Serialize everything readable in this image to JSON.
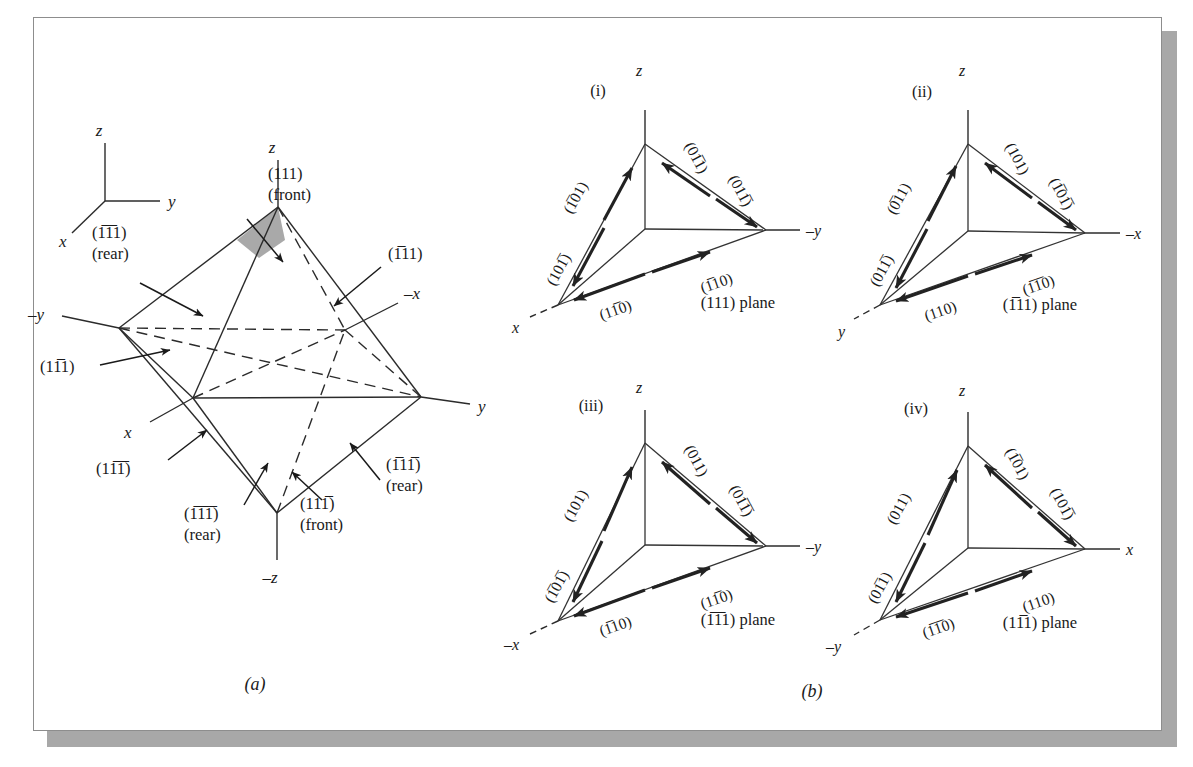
{
  "figure": {
    "captions": {
      "left": "(a)",
      "right": "(b)"
    }
  },
  "panel_a": {
    "axis_triad": {
      "z": "z",
      "y": "y",
      "x": "x"
    },
    "octahedron_axes": {
      "z": "z",
      "neg_z": "–z",
      "y": "y",
      "neg_y": "–y",
      "x": "x",
      "neg_x": "–x"
    },
    "face_labels": [
      {
        "id": "face-111-front",
        "plane": "(111)",
        "bars": [],
        "note": "(front)"
      },
      {
        "id": "face-b1b11-rear",
        "plane": "(111)",
        "bars": [
          0,
          1
        ],
        "note": "(rear)"
      },
      {
        "id": "face-b111",
        "plane": "(111)",
        "bars": [
          0
        ],
        "note": ""
      },
      {
        "id": "face-1b11",
        "plane": "(111)",
        "bars": [
          1
        ],
        "note": ""
      },
      {
        "id": "face-1b1b1",
        "plane": "(111)",
        "bars": [
          1,
          2
        ],
        "note": ""
      },
      {
        "id": "face-b1b1b1-rear",
        "plane": "(111)",
        "bars": [
          0,
          1,
          2
        ],
        "note": "(rear)"
      },
      {
        "id": "face-b11b1-rear",
        "plane": "(111)",
        "bars": [
          0,
          2
        ],
        "note": "(rear)"
      },
      {
        "id": "face-11b1-front",
        "plane": "(111)",
        "bars": [
          2
        ],
        "note": "(front)"
      }
    ]
  },
  "panel_b": {
    "tetrahedra": [
      {
        "id": "tet-i",
        "roman": "(i)",
        "plane_caption": "(111) plane",
        "plane_caption_bars": [],
        "axes": {
          "top": "z",
          "right": "–y",
          "left": "x"
        },
        "directions": [
          {
            "id": "dir-i-ul-upper",
            "text": "(101)",
            "bars": [
              0
            ]
          },
          {
            "id": "dir-i-ul-lower",
            "text": "(101)",
            "bars": [
              2
            ]
          },
          {
            "id": "dir-i-ur-upper",
            "text": "(011)",
            "bars": [
              1
            ]
          },
          {
            "id": "dir-i-ur-lower",
            "text": "(011)",
            "bars": [
              2
            ]
          },
          {
            "id": "dir-i-bot-right",
            "text": "(110)",
            "bars": [
              0
            ]
          },
          {
            "id": "dir-i-bot-left",
            "text": "(110)",
            "bars": [
              1
            ]
          }
        ]
      },
      {
        "id": "tet-ii",
        "roman": "(ii)",
        "plane_caption": "(111) plane",
        "plane_caption_bars": [
          0
        ],
        "axes": {
          "top": "z",
          "right": "–x",
          "left": "y"
        },
        "directions": [
          {
            "id": "dir-ii-ul-upper",
            "text": "(011)",
            "bars": [
              0
            ]
          },
          {
            "id": "dir-ii-ul-lower",
            "text": "(011)",
            "bars": [
              2
            ]
          },
          {
            "id": "dir-ii-ur-upper",
            "text": "(101)",
            "bars": []
          },
          {
            "id": "dir-ii-ur-lower",
            "text": "(101)",
            "bars": [
              0,
              2
            ]
          },
          {
            "id": "dir-ii-bot-right",
            "text": "(110)",
            "bars": [
              0,
              1
            ]
          },
          {
            "id": "dir-ii-bot-left",
            "text": "(110)",
            "bars": []
          }
        ]
      },
      {
        "id": "tet-iii",
        "roman": "(iii)",
        "plane_caption": "(111) plane",
        "plane_caption_bars": [
          0,
          1
        ],
        "axes": {
          "top": "z",
          "right": "–y",
          "left": "–x"
        },
        "directions": [
          {
            "id": "dir-iii-ul-upper",
            "text": "(101)",
            "bars": []
          },
          {
            "id": "dir-iii-ul-lower",
            "text": "(101)",
            "bars": [
              0,
              2
            ]
          },
          {
            "id": "dir-iii-ur-upper",
            "text": "(011)",
            "bars": []
          },
          {
            "id": "dir-iii-ur-lower",
            "text": "(011)",
            "bars": [
              1,
              2
            ]
          },
          {
            "id": "dir-iii-bot-right",
            "text": "(110)",
            "bars": [
              1
            ]
          },
          {
            "id": "dir-iii-bot-left",
            "text": "(110)",
            "bars": [
              0
            ]
          }
        ]
      },
      {
        "id": "tet-iv",
        "roman": "(iv)",
        "plane_caption": "(111) plane",
        "plane_caption_bars": [
          1
        ],
        "axes": {
          "top": "z",
          "right": "x",
          "left": "–y"
        },
        "directions": [
          {
            "id": "dir-iv-ul-upper",
            "text": "(011)",
            "bars": []
          },
          {
            "id": "dir-iv-ul-lower",
            "text": "(011)",
            "bars": [
              1
            ]
          },
          {
            "id": "dir-iv-ur-upper",
            "text": "(101)",
            "bars": [
              0
            ]
          },
          {
            "id": "dir-iv-ur-lower",
            "text": "(101)",
            "bars": [
              2
            ]
          },
          {
            "id": "dir-iv-bot-right",
            "text": "(110)",
            "bars": []
          },
          {
            "id": "dir-iv-bot-left",
            "text": "(110)",
            "bars": [
              0,
              1
            ]
          }
        ]
      }
    ]
  }
}
